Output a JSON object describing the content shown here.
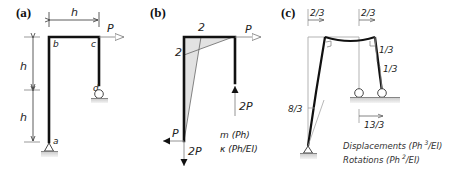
{
  "panels": {
    "a": {
      "label": "(a)",
      "dim_horizontal": "h",
      "dim_vertical_upper": "h",
      "dim_vertical_lower": "h",
      "load": "P",
      "nodes": {
        "a": "a",
        "b": "b",
        "c": "c",
        "d": "d"
      }
    },
    "b": {
      "label": "(b)",
      "top_value": "2",
      "left_value": "2",
      "load_top": "P",
      "reaction_right": "2P",
      "reaction_bottom_horizontal": "P",
      "reaction_bottom_vertical": "2P",
      "legend_moment": "m (Ph)",
      "legend_curvature": "κ (Ph/EI)"
    },
    "c": {
      "label": "(c)",
      "disp_top_left": "2/3",
      "disp_top_right": "2/3",
      "rot_right_upper": "1/3",
      "rot_right_lower": "1/3",
      "rot_left": "8/3",
      "disp_roller": "13/3",
      "legend_displacements": "Displacements (Ph",
      "legend_displacements_exp": "3",
      "legend_displacements_tail": "/EI)",
      "legend_rotations": "Rotations (Ph",
      "legend_rotations_exp": "2",
      "legend_rotations_tail": "/EI)"
    }
  },
  "colors": {
    "frame": "#111111",
    "shading": "#e2e2e2",
    "ground": "#d9d9d9",
    "arrow_outline": "#888888"
  }
}
